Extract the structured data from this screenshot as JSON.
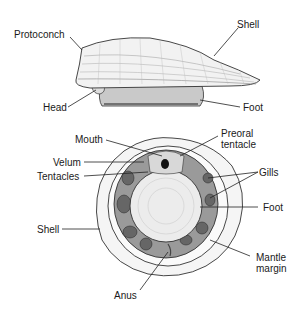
{
  "side_view": {
    "labels": {
      "protoconch": "Protoconch",
      "shell": "Shell",
      "head": "Head",
      "foot": "Foot"
    }
  },
  "ventral_view": {
    "labels": {
      "mouth": "Mouth",
      "preoral_tentacle_line1": "Preoral",
      "preoral_tentacle_line2": "tentacle",
      "velum": "Velum",
      "tentacles": "Tentacles",
      "gills": "Gills",
      "foot": "Foot",
      "shell": "Shell",
      "mantle_margin_line1": "Mantle",
      "mantle_margin_line2": "margin",
      "anus": "Anus"
    }
  },
  "colors": {
    "ink": "#1a1a1a",
    "shade": "#b8b8b8",
    "light": "#eeeeee",
    "background": "#ffffff"
  }
}
